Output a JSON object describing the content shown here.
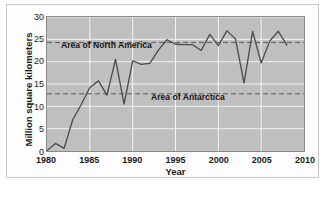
{
  "chart_data": {
    "type": "line",
    "title": "",
    "subtitle": "",
    "xlabel": "Year",
    "ylabel": "Million square kilometers",
    "xlim": [
      1980,
      2010
    ],
    "ylim": [
      0,
      30
    ],
    "xticks": [
      1980,
      1985,
      1990,
      1995,
      2000,
      2005,
      2010
    ],
    "yticks": [
      0,
      5,
      10,
      15,
      20,
      25,
      30
    ],
    "grid": true,
    "legend": "none",
    "line_color": "#4a4a4a",
    "plot_background": "#bfbfbf",
    "grid_color": "#f2f2f2",
    "reference_line_color": "#5a5a5a",
    "x": [
      1980,
      1981,
      1982,
      1983,
      1984,
      1985,
      1986,
      1987,
      1988,
      1989,
      1990,
      1991,
      1992,
      1993,
      1994,
      1995,
      1996,
      1997,
      1998,
      1999,
      2000,
      2001,
      2002,
      2003,
      2004,
      2005,
      2006,
      2007,
      2008
    ],
    "series": [
      {
        "name": "Ozone hole area",
        "values": [
          0.1,
          1.7,
          0.6,
          7.0,
          10.4,
          14.2,
          15.7,
          12.5,
          20.5,
          10.5,
          20.2,
          19.4,
          19.6,
          22.6,
          24.9,
          23.9,
          23.8,
          23.8,
          22.5,
          26.1,
          23.6,
          26.9,
          25.1,
          15.2,
          26.8,
          19.7,
          24.6,
          26.8,
          23.7
        ]
      }
    ],
    "reference_lines": [
      {
        "label": "Area of North America",
        "value": 24.3,
        "style": "dashed"
      },
      {
        "label": "Area of Antarctica",
        "value": 12.8,
        "style": "dashed"
      }
    ]
  },
  "annotations": {
    "north_america": "Area of North America",
    "antarctica": "Area of Antarctica"
  },
  "axis": {
    "xlabel": "Year",
    "ylabel": "Million square kilometers",
    "xticks": [
      "1980",
      "1985",
      "1990",
      "1995",
      "2000",
      "2005",
      "2010"
    ],
    "yticks": [
      "0",
      "5",
      "10",
      "15",
      "20",
      "25",
      "30"
    ]
  }
}
